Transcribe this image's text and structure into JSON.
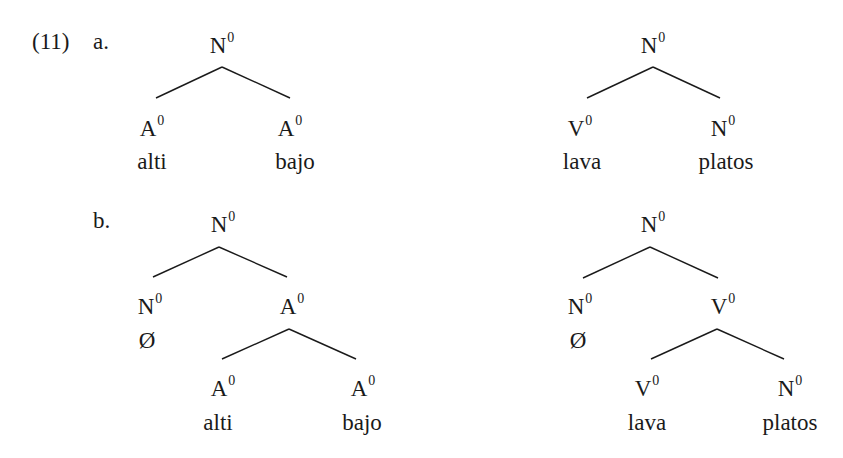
{
  "example": {
    "number": "(11)",
    "subparts": [
      "a.",
      "b."
    ]
  },
  "trees": {
    "a_left": {
      "root": {
        "cat": "N",
        "bar": "0"
      },
      "left": {
        "cat": "A",
        "bar": "0",
        "word": "alti"
      },
      "right": {
        "cat": "A",
        "bar": "0",
        "word": "bajo"
      }
    },
    "a_right": {
      "root": {
        "cat": "N",
        "bar": "0"
      },
      "left": {
        "cat": "V",
        "bar": "0",
        "word": "lava"
      },
      "right": {
        "cat": "N",
        "bar": "0",
        "word": "platos"
      }
    },
    "b_left": {
      "root": {
        "cat": "N",
        "bar": "0"
      },
      "left": {
        "cat": "N",
        "bar": "0",
        "word": "Ø"
      },
      "right": {
        "cat": "A",
        "bar": "0"
      },
      "right_left": {
        "cat": "A",
        "bar": "0",
        "word": "alti"
      },
      "right_right": {
        "cat": "A",
        "bar": "0",
        "word": "bajo"
      }
    },
    "b_right": {
      "root": {
        "cat": "N",
        "bar": "0"
      },
      "left": {
        "cat": "N",
        "bar": "0",
        "word": "Ø"
      },
      "right": {
        "cat": "V",
        "bar": "0"
      },
      "right_left": {
        "cat": "V",
        "bar": "0",
        "word": "lava"
      },
      "right_right": {
        "cat": "N",
        "bar": "0",
        "word": "platos"
      }
    }
  }
}
